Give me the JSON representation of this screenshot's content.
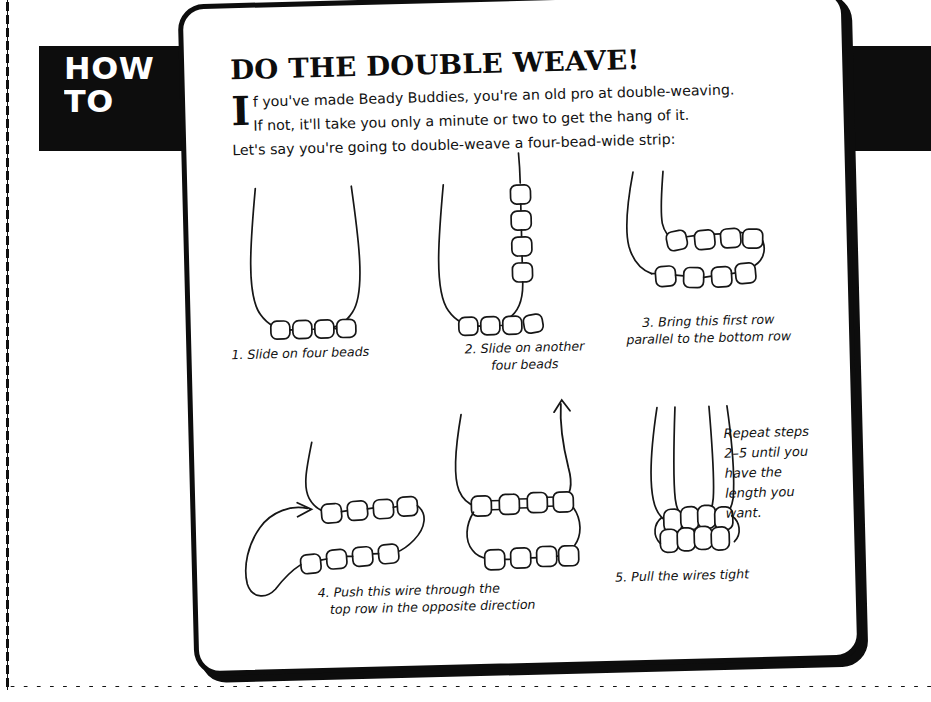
{
  "tab": {
    "line1": "HOW",
    "line2": "TO"
  },
  "card": {
    "headline": "DO THE DOUBLE WEAVE!",
    "dropcap": "I",
    "intro_line1": "f you've made Beady Buddies, you're an old pro at double-weaving.",
    "intro_line2": "If not, it'll take you only a minute or two to get the hang of it.",
    "intro_line3": "Let's say you're going to double-weave a four-bead-wide strip:"
  },
  "steps": [
    {
      "id": "step-1",
      "caption_line1": "1. Slide on four beads",
      "caption_line2": "",
      "beads_bottom": 4
    },
    {
      "id": "step-2",
      "caption_line1": "2. Slide on another",
      "caption_line2": "four beads",
      "beads_bottom": 4,
      "beads_vertical": 4
    },
    {
      "id": "step-3",
      "caption_line1": "3. Bring this first row",
      "caption_line2": "parallel to the bottom row",
      "beads_top": 4,
      "beads_bottom": 4
    },
    {
      "id": "step-4",
      "caption_line1": "4. Push this wire through the",
      "caption_line2": "top row in the opposite direction",
      "beads_top": 4,
      "beads_bottom": 4
    },
    {
      "id": "step-5",
      "caption_line1": "5. Pull the wires tight",
      "caption_line2": "",
      "beads_top": 4,
      "beads_bottom": 4
    }
  ],
  "note": {
    "line1": "Repeat steps",
    "line2": "2–5 until you",
    "line3": "have the",
    "line4": "length you",
    "line5": "want."
  },
  "colors": {
    "ink": "#0d0d0d",
    "paper": "#ffffff",
    "line": "#161616"
  }
}
